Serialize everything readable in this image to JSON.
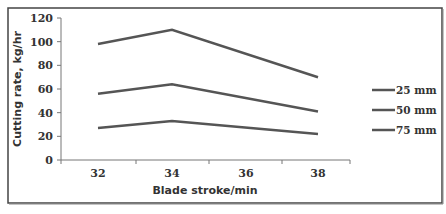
{
  "chart_data": {
    "type": "line",
    "title": "",
    "xlabel": "Blade stroke/min",
    "ylabel": "Cutting rate, kg/hr",
    "categories": [
      "32",
      "34",
      "36",
      "38"
    ],
    "x": [
      32,
      34,
      36,
      38
    ],
    "ylim": [
      0,
      120
    ],
    "yticks": [
      0,
      20,
      40,
      60,
      80,
      100,
      120
    ],
    "grid": false,
    "legend_position": "right",
    "series": [
      {
        "name": "25 mm",
        "values": [
          98,
          110,
          null,
          70
        ],
        "color": "#555555"
      },
      {
        "name": "50 mm",
        "values": [
          56,
          64,
          null,
          41
        ],
        "color": "#555555"
      },
      {
        "name": "75 mm",
        "values": [
          27,
          33,
          null,
          22
        ],
        "color": "#555555"
      }
    ],
    "plotted_points_note": "lines connect 32, 34 and 38"
  },
  "legend": [
    {
      "label": "25 mm"
    },
    {
      "label": "50 mm"
    },
    {
      "label": "75 mm"
    }
  ],
  "axes": {
    "x_title": "Blade stroke/min",
    "y_title": "Cutting rate, kg/hr",
    "x_ticks": [
      "32",
      "34",
      "36",
      "38"
    ],
    "y_ticks": [
      "0",
      "20",
      "40",
      "60",
      "80",
      "100",
      "120"
    ]
  }
}
